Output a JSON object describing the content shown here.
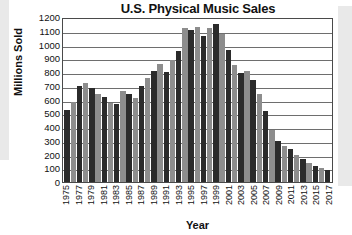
{
  "chart_data": {
    "type": "bar",
    "title": "U.S. Physical Music Sales",
    "xlabel": "Year",
    "ylabel": "Millions Sold",
    "ylim": [
      0,
      1200
    ],
    "ytick_step": 100,
    "yticks": [
      "1200",
      "1100",
      "1000",
      "900",
      "800",
      "700",
      "600",
      "500",
      "400",
      "300",
      "200",
      "100",
      "0"
    ],
    "grid": true,
    "legend": "none",
    "xtick_interval": 2,
    "bar_colors": [
      "#2b2b2b",
      "#8d8d8d"
    ],
    "categories": [
      "1975",
      "1976",
      "1977",
      "1978",
      "1979",
      "1980",
      "1981",
      "1982",
      "1983",
      "1984",
      "1985",
      "1986",
      "1987",
      "1988",
      "1989",
      "1990",
      "1991",
      "1992",
      "1993",
      "1994",
      "1995",
      "1996",
      "1997",
      "1998",
      "1999",
      "2000",
      "2001",
      "2002",
      "2003",
      "2004",
      "2005",
      "2006",
      "2007",
      "2008",
      "2009",
      "2010",
      "2011",
      "2012",
      "2013",
      "2014",
      "2015",
      "2016",
      "2017"
    ],
    "xtick_labels": [
      "1975",
      "",
      "1977",
      "",
      "1979",
      "",
      "1981",
      "",
      "1983",
      "",
      "1985",
      "",
      "1987",
      "",
      "1989",
      "",
      "1991",
      "",
      "1993",
      "",
      "1995",
      "",
      "1997",
      "",
      "1999",
      "",
      "2001",
      "",
      "2003",
      "",
      "2005",
      "",
      "2007",
      "",
      "2009",
      "",
      "2011",
      "",
      "2013",
      "",
      "2015",
      "",
      "2017"
    ],
    "values": [
      525,
      585,
      695,
      720,
      685,
      640,
      615,
      575,
      570,
      665,
      640,
      610,
      700,
      755,
      805,
      860,
      800,
      885,
      950,
      1120,
      1105,
      1130,
      1060,
      1120,
      1150,
      1075,
      960,
      850,
      795,
      810,
      740,
      640,
      520,
      375,
      300,
      260,
      240,
      200,
      170,
      140,
      120,
      100,
      90
    ]
  }
}
